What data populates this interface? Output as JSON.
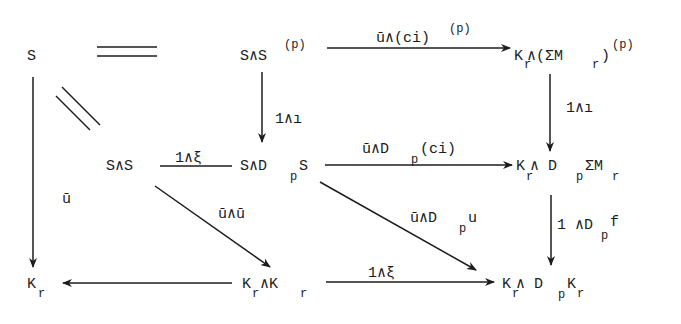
{
  "diagram": {
    "type": "commutative-diagram",
    "nodes": {
      "S_top": {
        "base": "S"
      },
      "SsmashSp": {
        "base": "S∧S",
        "sup": "(p)"
      },
      "KrSmashSigmaMp": {
        "parts": [
          "K",
          "r",
          " ∧(ΣM",
          "r",
          ")",
          "(p)"
        ]
      },
      "SsmashS": {
        "base": "S∧S"
      },
      "SsmashDpS": {
        "parts": [
          "S∧D",
          "p",
          "S"
        ]
      },
      "KrSmashDpSigmaMr": {
        "parts": [
          "K",
          "r",
          " ∧ D",
          "p",
          "ΣM",
          "r"
        ]
      },
      "Kr_left": {
        "parts": [
          "K",
          "r"
        ]
      },
      "KrSmashKr": {
        "parts": [
          "K",
          "r",
          "∧K",
          "r"
        ]
      },
      "KrSmashDpKr": {
        "parts": [
          "K",
          "r",
          "∧ D",
          "p",
          "K",
          "r"
        ]
      }
    },
    "labels": {
      "top_horizontal": {
        "parts": [
          "ū∧(ci)",
          "(p)"
        ]
      },
      "mid_vertical": {
        "text": "1∧ı"
      },
      "right_top_vertical": {
        "text": "1∧ı"
      },
      "mid_left_horizontal": {
        "text": "1∧ξ"
      },
      "mid_right_horizontal": {
        "parts": [
          "ū∧D",
          "p",
          "(ci)"
        ]
      },
      "left_vertical": {
        "text": "ū"
      },
      "diag_left": {
        "text": "ū∧ū"
      },
      "diag_right": {
        "parts": [
          "ū∧D",
          "p",
          "u"
        ]
      },
      "right_bottom_vertical": {
        "parts": [
          "1 ∧D",
          "p",
          "f"
        ]
      },
      "bottom_right_horizontal": {
        "text": "1∧ξ"
      }
    },
    "arrows": [
      {
        "from": "S_top",
        "to": "SsmashSp",
        "style": "equality"
      },
      {
        "from": "SsmashSp",
        "to": "KrSmashSigmaMp",
        "label": "top_horizontal"
      },
      {
        "from": "SsmashSp",
        "to": "SsmashDpS",
        "label": "mid_vertical"
      },
      {
        "from": "KrSmashSigmaMp",
        "to": "KrSmashDpSigmaMr",
        "label": "right_top_vertical"
      },
      {
        "from": "S_top",
        "to": "SsmashS",
        "style": "equality"
      },
      {
        "from": "SsmashS",
        "to": "SsmashDpS",
        "label": "mid_left_horizontal",
        "style": "line"
      },
      {
        "from": "SsmashDpS",
        "to": "KrSmashDpSigmaMr",
        "label": "mid_right_horizontal"
      },
      {
        "from": "S_top",
        "to": "Kr_left",
        "label": "left_vertical"
      },
      {
        "from": "SsmashS",
        "to": "KrSmashKr",
        "label": "diag_left"
      },
      {
        "from": "SsmashDpS",
        "to": "KrSmashDpKr",
        "label": "diag_right"
      },
      {
        "from": "KrSmashDpSigmaMr",
        "to": "KrSmashDpKr",
        "label": "right_bottom_vertical"
      },
      {
        "from": "KrSmashKr",
        "to": "Kr_left"
      },
      {
        "from": "KrSmashKr",
        "to": "KrSmashDpKr",
        "label": "bottom_right_horizontal"
      }
    ],
    "ink_color": "#1c1c1c",
    "background": "#ffffff"
  }
}
